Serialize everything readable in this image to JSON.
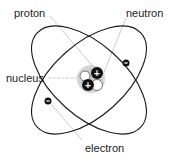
{
  "labels": {
    "proton": "proton",
    "neutron": "neutron",
    "nucleus": "nucleus",
    "electron": "electron"
  },
  "symbols": {
    "proton_charge": "+",
    "electron_charge": "−"
  },
  "colors": {
    "orbit": "#1a1a1a",
    "leader": "#bbbbbb",
    "halo": "#cfcfcf",
    "proton_fill": "#111111",
    "neutron_fill": "#ffffff"
  }
}
